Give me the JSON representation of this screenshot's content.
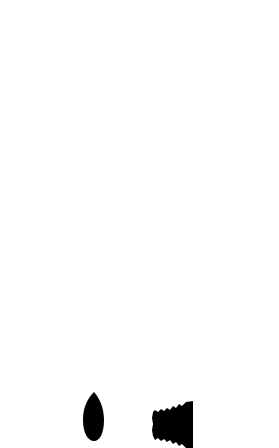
{
  "caption": {
    "text": "Nodal mutant / wild-type ...",
    "visible": "cropped (only lower edge of glyphs shown)"
  },
  "colors": {
    "line": "#111111",
    "thick_bar": "#000000",
    "open_circle_fill": "#ffffff",
    "filled_circle": "#111111",
    "ligand_col_a": "#dcdcdc",
    "ligand_col_b": "#222222",
    "ligand_col_c": "#aaaaaa",
    "arrow_dark": "#2e2e2e",
    "arrow_mid": "#6e6e6e",
    "arrow_light": "#a0a0a0"
  },
  "grid": {
    "columns": [
      "narrow-left",
      "channel",
      "column-a",
      "column-b",
      "column-c",
      "thick-bar",
      "right-empty"
    ],
    "rows": [
      {
        "row": 1,
        "receptors": {
          "a": "unbound",
          "b": "unbound",
          "c": "unbound"
        },
        "arrows": []
      },
      {
        "row": 2,
        "receptors": {
          "a": "bound",
          "b": "unbound",
          "c": "unbound"
        },
        "arrows": [
          {
            "shade": "mid",
            "target": "column-a"
          }
        ]
      },
      {
        "row": 3,
        "receptors": {
          "a": "unbound",
          "b": "bound",
          "c": "unbound"
        },
        "arrows": [
          {
            "shade": "light",
            "target": "column-b"
          }
        ]
      },
      {
        "row": 4,
        "receptors": {
          "a": "unbound",
          "b": "unbound",
          "c": "bound"
        },
        "arrows": [
          {
            "shade": "dark",
            "target": "column-c"
          }
        ]
      },
      {
        "row": 5,
        "receptors": {
          "a": "bound",
          "b": "bound",
          "c": "bound"
        },
        "arrows": [
          {
            "shade": "dark",
            "target": "column-c"
          },
          {
            "shade": "light",
            "target": "column-b"
          },
          {
            "shade": "mid",
            "target": "column-a"
          }
        ]
      }
    ],
    "receptors_per_cell": 3
  },
  "bottom_icons": [
    {
      "name": "dropper-bulb-icon",
      "shape": "teardrop"
    },
    {
      "name": "bellows-icon",
      "shape": "ribbed-cone"
    }
  ]
}
